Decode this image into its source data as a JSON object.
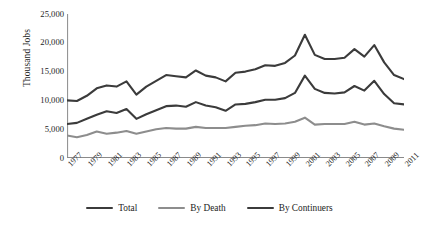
{
  "chart_data": {
    "type": "line",
    "title": "",
    "xlabel": "",
    "ylabel": "Thousand Jobs",
    "ylim": [
      0,
      25000
    ],
    "yticks": [
      0,
      5000,
      10000,
      15000,
      20000,
      25000
    ],
    "ytick_labels": [
      "0",
      "5,000",
      "10,000",
      "15,000",
      "20,000",
      "25,000"
    ],
    "grid": false,
    "legend_position": "bottom",
    "x": [
      1977,
      1978,
      1979,
      1980,
      1981,
      1982,
      1983,
      1984,
      1985,
      1986,
      1987,
      1988,
      1989,
      1990,
      1991,
      1992,
      1993,
      1994,
      1995,
      1996,
      1997,
      1998,
      1999,
      2000,
      2001,
      2002,
      2003,
      2004,
      2005,
      2006,
      2007,
      2008,
      2009,
      2010,
      2011
    ],
    "xtick_labels": [
      "1977",
      "1979",
      "1981",
      "1983",
      "1985",
      "1987",
      "1989",
      "1991",
      "1993",
      "1995",
      "1997",
      "1999",
      "2001",
      "2003",
      "2005",
      "2007",
      "2009",
      "2011"
    ],
    "xtick_values": [
      1977,
      1979,
      1981,
      1983,
      1985,
      1987,
      1989,
      1991,
      1993,
      1995,
      1997,
      1999,
      2001,
      2003,
      2005,
      2007,
      2009,
      2011
    ],
    "series": [
      {
        "name": "Total",
        "color": "#3b3b3b",
        "width": 2.1,
        "values": [
          10000,
          9900,
          10800,
          12100,
          12600,
          12400,
          13300,
          11000,
          12400,
          13400,
          14400,
          14200,
          14000,
          15200,
          14300,
          14000,
          13300,
          14800,
          15000,
          15400,
          16100,
          16000,
          16500,
          17800,
          21400,
          17900,
          17200,
          17200,
          17400,
          18900,
          17600,
          19600,
          16600,
          14400,
          13700
        ]
      },
      {
        "name": "By Death",
        "color": "#8d8d8d",
        "width": 2.1,
        "values": [
          3900,
          3600,
          4000,
          4600,
          4200,
          4400,
          4700,
          4200,
          4600,
          5000,
          5200,
          5100,
          5100,
          5400,
          5200,
          5200,
          5200,
          5400,
          5600,
          5700,
          6000,
          5900,
          6000,
          6300,
          7000,
          5800,
          5900,
          5900,
          5900,
          6300,
          5800,
          6000,
          5500,
          5100,
          4900
        ]
      },
      {
        "name": "By Continuers",
        "color": "#3b3b3b",
        "width": 2.1,
        "values": [
          5900,
          6100,
          6800,
          7500,
          8100,
          7800,
          8500,
          6800,
          7600,
          8300,
          9000,
          9100,
          8900,
          9700,
          9100,
          8800,
          8200,
          9300,
          9400,
          9700,
          10100,
          10100,
          10400,
          11300,
          14300,
          12000,
          11300,
          11200,
          11400,
          12500,
          11700,
          13400,
          11100,
          9500,
          9300
        ]
      }
    ]
  },
  "legend": {
    "items": [
      {
        "label": "Total",
        "color": "#3b3b3b"
      },
      {
        "label": "By Death",
        "color": "#8d8d8d"
      },
      {
        "label": "By Continuers",
        "color": "#3b3b3b"
      }
    ]
  },
  "axis": {
    "color": "#8a8a8a"
  }
}
